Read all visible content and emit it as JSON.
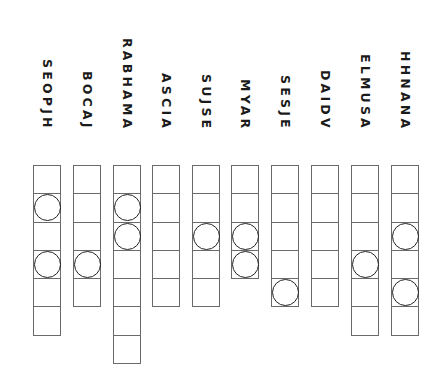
{
  "columns": [
    {
      "label": "SEOPJH",
      "cells": 6,
      "circles": [
        2,
        4
      ]
    },
    {
      "label": "BOCAJ",
      "cells": 5,
      "circles": [
        4
      ]
    },
    {
      "label": "RABHAMA",
      "cells": 7,
      "circles": [
        2,
        3
      ]
    },
    {
      "label": "ASCIA",
      "cells": 5,
      "circles": []
    },
    {
      "label": "SUJSE",
      "cells": 5,
      "circles": [
        3
      ]
    },
    {
      "label": "MYAR",
      "cells": 4,
      "circles": [
        3,
        4
      ]
    },
    {
      "label": "SESJE",
      "cells": 5,
      "circles": [
        5
      ]
    },
    {
      "label": "DAIDV",
      "cells": 5,
      "circles": []
    },
    {
      "label": "ELMUSA",
      "cells": 6,
      "circles": [
        4
      ]
    },
    {
      "label": "HHNANA",
      "cells": 6,
      "circles": [
        3,
        5
      ]
    }
  ],
  "layout": {
    "col_left": [
      33,
      73,
      113,
      152,
      192,
      231,
      271,
      311,
      351,
      391
    ]
  }
}
